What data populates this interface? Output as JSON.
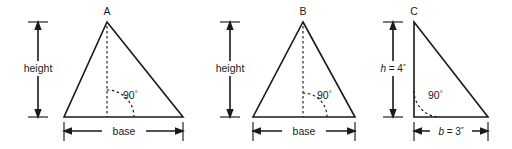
{
  "figure": {
    "stroke_color": "#1a1a1a",
    "background_color": "#ffffff",
    "triangles": [
      {
        "id": "a",
        "vertex_label": "A",
        "shape": "scalene-triangle",
        "height_label": "height",
        "base_label": "base",
        "angle_label": "90",
        "angle_unit": "°",
        "altitude": "dashed-interior"
      },
      {
        "id": "b",
        "vertex_label": "B",
        "shape": "isosceles-triangle",
        "height_label": "height",
        "base_label": "base",
        "angle_label": "90",
        "angle_unit": "°",
        "altitude": "dashed-interior"
      },
      {
        "id": "c",
        "vertex_label": "C",
        "shape": "right-triangle",
        "height_label_var": "h",
        "height_label_eq": " = 4",
        "height_label_unit": "″",
        "base_label_var": "b",
        "base_label_eq": " = 3",
        "base_label_unit": "″",
        "angle_label": "90",
        "angle_unit": "°",
        "altitude": "solid-left-leg"
      }
    ]
  }
}
